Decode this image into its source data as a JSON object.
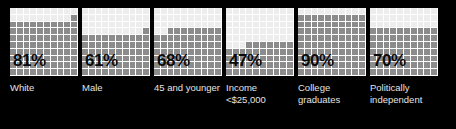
{
  "background_color": "#000000",
  "palette": {
    "filled_cell": "#8c8c8c",
    "empty_cell": "#ededed",
    "gridline": "#ffffff",
    "percent_text": "#0a0a0a",
    "caption_text": "#e3e3e3"
  },
  "chart_data": {
    "type": "bar",
    "subtype": "waffle-grid-100",
    "title": "",
    "xlabel": "",
    "ylabel": "",
    "ylim": [
      0,
      100
    ],
    "grid": true,
    "legend": "none",
    "units": "percent",
    "cells_per_chart": 100,
    "categories": [
      "White",
      "Male",
      "45 and younger",
      "Income <$25,000",
      "College graduates",
      "Politically independent"
    ],
    "values": [
      81,
      61,
      68,
      47,
      90,
      70
    ],
    "value_labels": [
      "81%",
      "61%",
      "68%",
      "47%",
      "90%",
      "70%"
    ]
  },
  "charts": [
    {
      "value": 81,
      "value_label": "81%",
      "caption": "White",
      "caption_lines": [
        "White"
      ]
    },
    {
      "value": 61,
      "value_label": "61%",
      "caption": "Male",
      "caption_lines": [
        "Male"
      ]
    },
    {
      "value": 68,
      "value_label": "68%",
      "caption": "45 and younger",
      "caption_lines": [
        "45 and",
        "younger"
      ]
    },
    {
      "value": 47,
      "value_label": "47%",
      "caption": "Income <$25,000",
      "caption_lines": [
        "Income",
        "<$25,000"
      ]
    },
    {
      "value": 90,
      "value_label": "90%",
      "caption": "College graduates",
      "caption_lines": [
        "College",
        "graduates"
      ]
    },
    {
      "value": 70,
      "value_label": "70%",
      "caption": "Politically independent",
      "caption_lines": [
        "Politically",
        "independent"
      ]
    }
  ]
}
